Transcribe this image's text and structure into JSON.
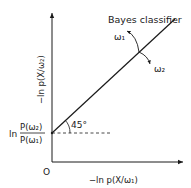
{
  "diagram": {
    "y_axis_label": "−ln p(X/ω₂)",
    "x_axis_label": "−ln p(X/ω₁)",
    "origin_label": "O",
    "boundary_label": "Bayes classifier",
    "region_labels": [
      "ω₁",
      "ω₂"
    ],
    "angle_label": "45°",
    "intercept_label": {
      "prefix": "ln",
      "numerator": "P(ω₂)",
      "denominator": "P(ω₁)"
    },
    "colors": {
      "ink": "#1a1a1a",
      "background": "#ffffff"
    }
  }
}
